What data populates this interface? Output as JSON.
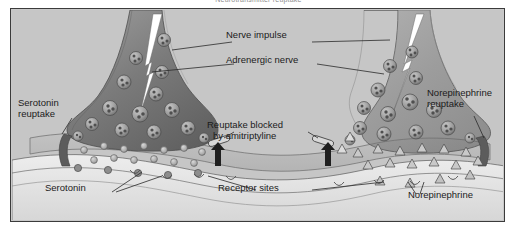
{
  "figure": {
    "title": "Neurotransmitter reuptake",
    "type": "medical-illustration",
    "palette": {
      "page_background": "#ffffff",
      "panel_background": "#c6c6c6",
      "panel_border": "#3b3b3b",
      "neuron_dark": "#6f6f6f",
      "neuron_mid": "#8d8d8d",
      "neuron_light": "#b0b0b0",
      "cleft_fill": "#bdbdbd",
      "membrane_light": "#e6e6e6",
      "impulse_white": "#ffffff",
      "label_text": "#1b1b1b",
      "leader_line": "#2a2a2a"
    }
  },
  "labels": {
    "nerve_impulse": "Nerve impulse",
    "adrenergic_nerve": "Adrenergic nerve",
    "serotonin_reuptake": "Serotonin\nreuptake",
    "serotonin_reuptake_l1": "Serotonin",
    "serotonin_reuptake_l2": "reuptake",
    "norepinephrine_reuptake_l1": "Norepinephrine",
    "norepinephrine_reuptake_l2": "reuptake",
    "reuptake_blocked_l1": "Reuptake blocked",
    "reuptake_blocked_l2": "by amitriptyline",
    "serotonin": "Serotonin",
    "receptor_sites": "Receptor sites",
    "norepinephrine": "Norepinephrine"
  },
  "diagram_elements": {
    "left_terminal": {
      "name": "serotonergic-nerve-terminal",
      "neurotransmitter_shape": "circle",
      "neurotransmitter_name": "Serotonin",
      "vesicle_count": 14,
      "free_transmitter_count": 18,
      "reuptake_label": "Serotonin reuptake",
      "reuptake_blocked": true
    },
    "right_terminal": {
      "name": "adrenergic-nerve-terminal",
      "neurotransmitter_shape": "triangle",
      "neurotransmitter_name": "Norepinephrine",
      "vesicle_count": 16,
      "free_transmitter_count": 18,
      "reuptake_label": "Norepinephrine reuptake",
      "reuptake_blocked": true
    },
    "impulse": {
      "name": "nerve-impulse-bolt",
      "shape": "lightning-bolt",
      "color": "#ffffff",
      "count": 2,
      "direction": "downward"
    },
    "blocker": {
      "name": "reuptake-blocker-symbol",
      "description": "Upward arrow crossed by a capsule bar indicating blocked reuptake",
      "count": 2,
      "drug": "amitriptyline"
    },
    "postsynaptic_membrane": {
      "name": "postsynaptic-membrane",
      "receptor_sites": 8,
      "description": "Scalloped membrane band with receptor pockets"
    }
  }
}
